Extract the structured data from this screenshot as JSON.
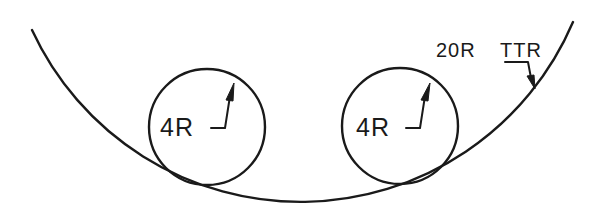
{
  "drawing": {
    "type": "technical-drawing",
    "line_color": "#1a1a1a",
    "background": "#ffffff",
    "outer_arc": {
      "label": "20R TTR",
      "label_part1": "20R",
      "label_part2": "TTR"
    },
    "circles": [
      {
        "label": "4R"
      },
      {
        "label": "4R"
      }
    ]
  }
}
